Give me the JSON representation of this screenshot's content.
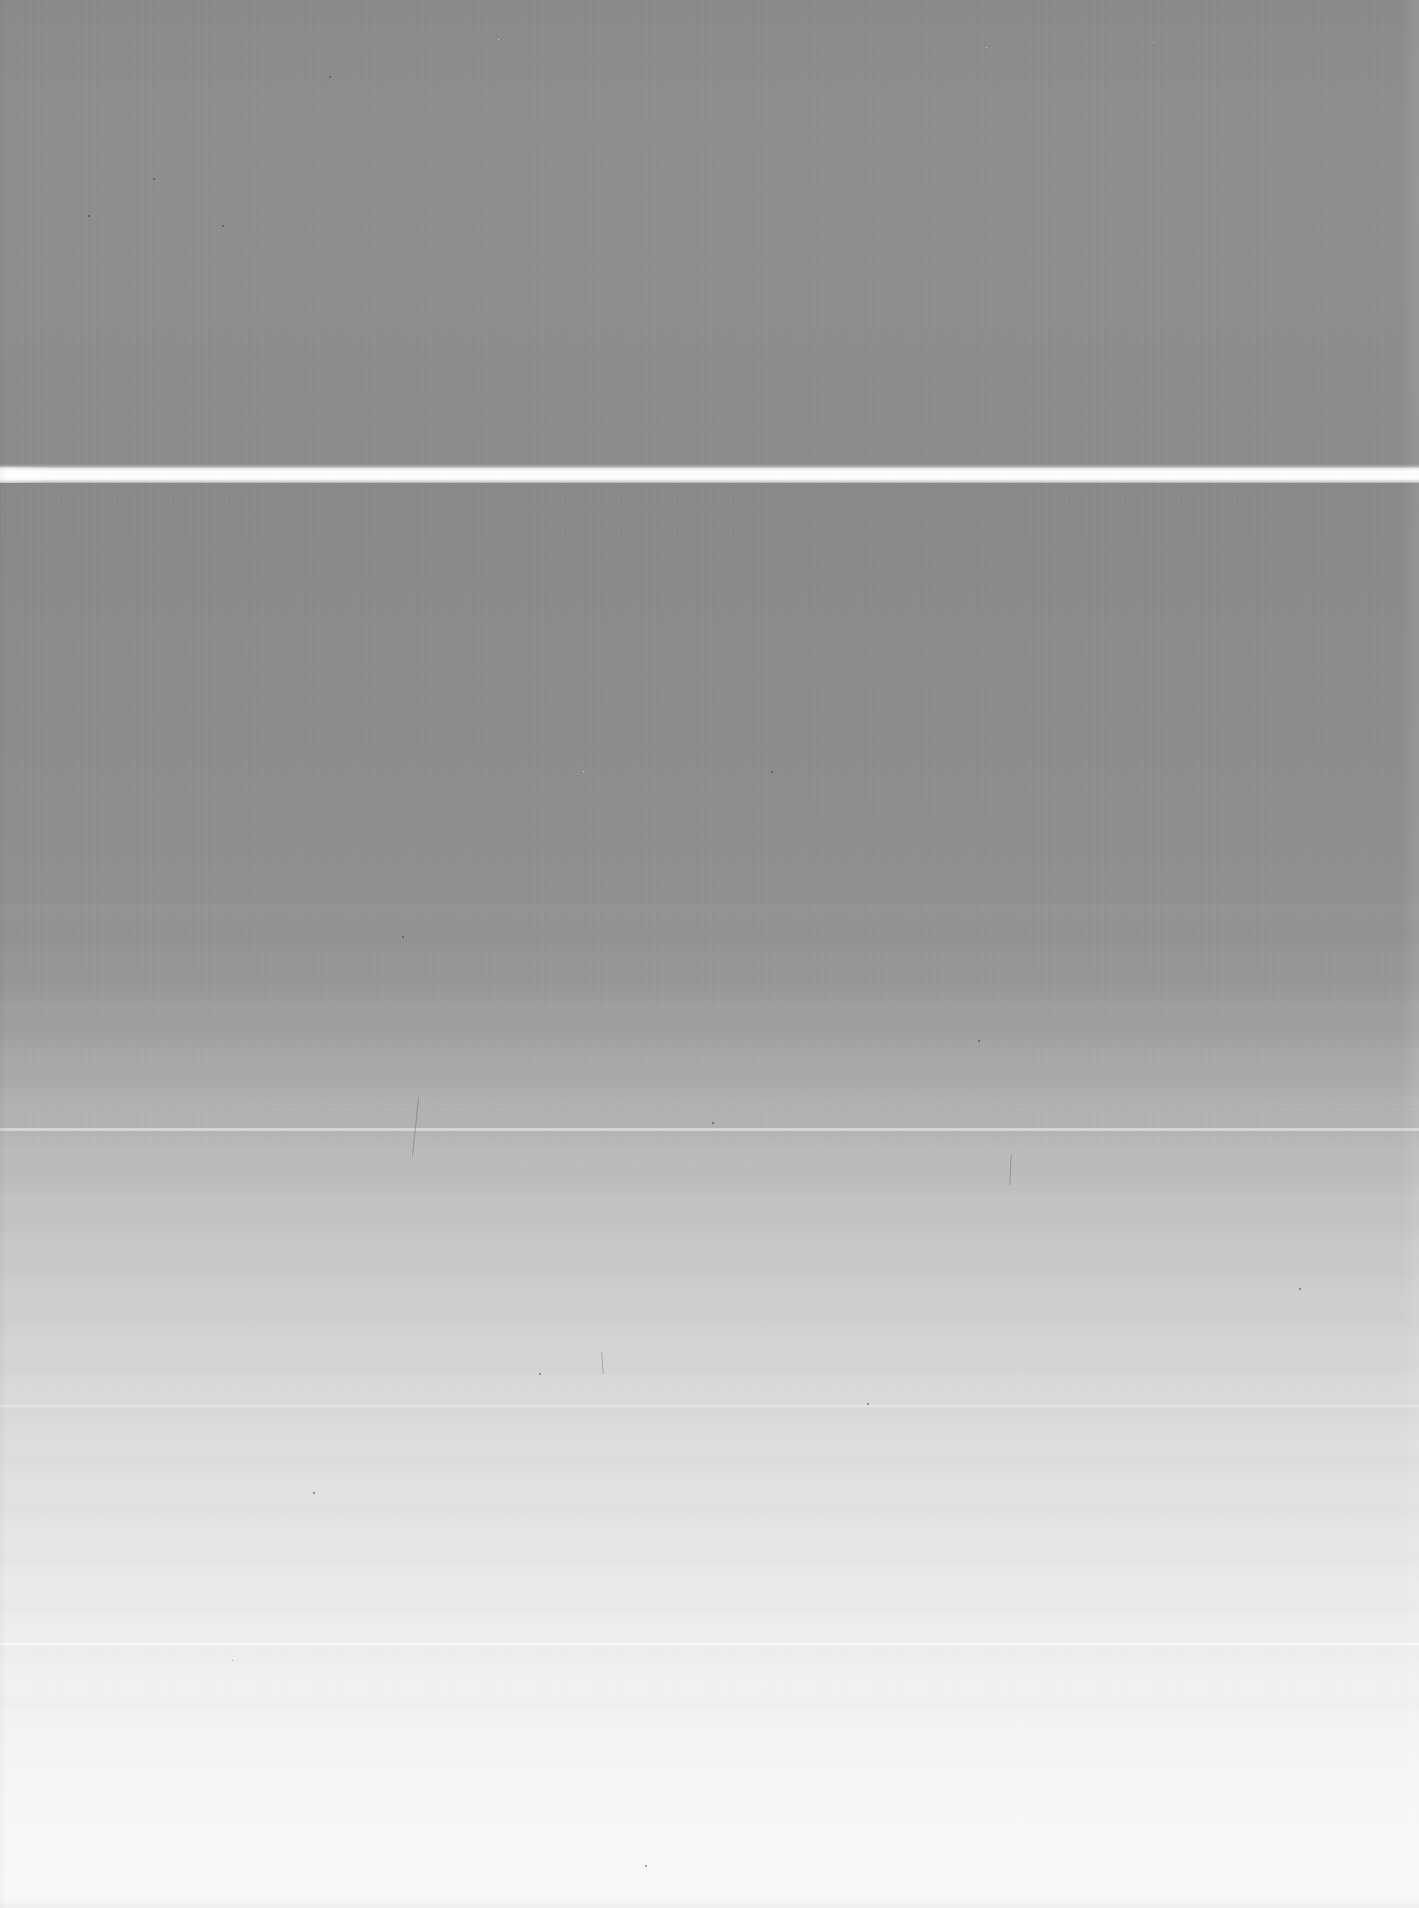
{
  "capture": {
    "kind": "scanned-blank-page",
    "width_px": 1419,
    "height_px": 1908,
    "visible_text": "",
    "description_label": "Blank scanned surface with horizontal white streak artifact"
  },
  "colors": {
    "upper_field_gray": "#8c8c8c",
    "streak_white": "#ffffff",
    "lower_field_top_gray": "#898989",
    "lower_field_bottom_white": "#fbfbfb",
    "bottom_edge_shadow": "#808080",
    "right_edge_highlight": "#f2f2f2"
  },
  "regions": [
    {
      "name": "upper-gray-field",
      "top_px": 0,
      "height_px": 468,
      "fill": "#8c8c8c",
      "note": "flat medium gray, fine dither noise"
    },
    {
      "name": "white-streak",
      "top_px": 464,
      "height_px": 22,
      "fill": "#ffffff",
      "note": "full-width bright horizontal scanner artifact"
    },
    {
      "name": "lower-gradient-field",
      "top_px": 483,
      "height_px": 1425,
      "fill_from": "#898989",
      "fill_to": "#fbfbfb",
      "note": "smooth vertical gradient with horizontal scan banding"
    }
  ],
  "artifacts": {
    "scanline_banding": "horizontal",
    "dither_pattern": "2px checker",
    "vertical_streaking": "present in lower half",
    "dust_speck_count": 14,
    "band_lines_px": [
      1106,
      1128,
      1405,
      1643
    ]
  },
  "specks": [
    {
      "x": 153,
      "y": 178,
      "size": 2,
      "tone": "dark"
    },
    {
      "x": 222,
      "y": 225,
      "size": 2,
      "tone": "dark"
    },
    {
      "x": 88,
      "y": 215,
      "size": 2,
      "tone": "dark"
    },
    {
      "x": 329,
      "y": 76,
      "size": 2,
      "tone": "dark"
    },
    {
      "x": 498,
      "y": 39,
      "size": 1,
      "tone": "light"
    },
    {
      "x": 986,
      "y": 47,
      "size": 1,
      "tone": "light"
    },
    {
      "x": 1153,
      "y": 42,
      "size": 1,
      "tone": "light"
    },
    {
      "x": 771,
      "y": 771,
      "size": 2,
      "tone": "dark"
    },
    {
      "x": 583,
      "y": 771,
      "size": 1,
      "tone": "light"
    },
    {
      "x": 402,
      "y": 936,
      "size": 2,
      "tone": "dark"
    },
    {
      "x": 712,
      "y": 1122,
      "size": 2,
      "tone": "dark"
    },
    {
      "x": 539,
      "y": 1373,
      "size": 2,
      "tone": "dark"
    },
    {
      "x": 867,
      "y": 1403,
      "size": 2,
      "tone": "dark"
    },
    {
      "x": 978,
      "y": 1040,
      "size": 2,
      "tone": "dark"
    },
    {
      "x": 1299,
      "y": 1288,
      "size": 2,
      "tone": "dark"
    },
    {
      "x": 313,
      "y": 1492,
      "size": 2,
      "tone": "dark"
    },
    {
      "x": 779,
      "y": 1426,
      "size": 1,
      "tone": "light"
    },
    {
      "x": 645,
      "y": 1865,
      "size": 2,
      "tone": "dark"
    },
    {
      "x": 232,
      "y": 1660,
      "size": 1,
      "tone": "dark"
    }
  ],
  "hairs": [
    {
      "x": 415,
      "y": 1098,
      "w": 1,
      "h": 58,
      "rot": 6
    },
    {
      "x": 602,
      "y": 1352,
      "w": 1,
      "h": 22,
      "rot": -4
    },
    {
      "x": 1010,
      "y": 1155,
      "w": 1,
      "h": 30,
      "rot": 3
    }
  ]
}
